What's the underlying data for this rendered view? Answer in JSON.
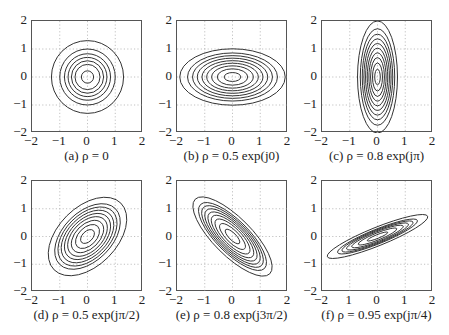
{
  "chart_data": [
    {
      "type": "contour",
      "id": "a",
      "caption": "(a) ρ = 0",
      "xlim": [
        -2,
        2
      ],
      "ylim": [
        -2,
        2
      ],
      "xticks": [
        "−2",
        "−1",
        "0",
        "1",
        "2"
      ],
      "yticks": [
        "2",
        "1",
        "0",
        "−1",
        "−2"
      ],
      "grid": "dotted",
      "contours": {
        "rx": [
          0.22,
          0.45,
          0.58,
          0.7,
          0.83,
          1.0,
          1.3
        ],
        "ry_ratio": 1.0,
        "angle_deg": 0
      }
    },
    {
      "type": "contour",
      "id": "b",
      "caption": "(b) ρ = 0.5 exp(j0)",
      "xlim": [
        -2,
        2
      ],
      "ylim": [
        -2,
        2
      ],
      "xticks": [
        "−2",
        "−1",
        "0",
        "1",
        "2"
      ],
      "yticks": [
        "2",
        "1",
        "0",
        "−1",
        "−2"
      ],
      "grid": "dotted",
      "contours": {
        "rx": [
          0.3,
          0.55,
          0.75,
          0.93,
          1.1,
          1.27,
          1.44,
          1.62,
          1.9
        ],
        "ry_ratio": 0.53,
        "angle_deg": 0
      }
    },
    {
      "type": "contour",
      "id": "c",
      "caption": "(c) ρ = 0.8 exp(jπ)",
      "xlim": [
        -2,
        2
      ],
      "ylim": [
        -2,
        2
      ],
      "xticks": [
        "−2",
        "−1",
        "0",
        "1",
        "2"
      ],
      "yticks": [
        "2",
        "1",
        "0",
        "−1",
        "−2"
      ],
      "grid": "dotted",
      "contours": {
        "rx": [
          0.1,
          0.18,
          0.25,
          0.31,
          0.37,
          0.43,
          0.49,
          0.55,
          0.62,
          0.72
        ],
        "ry_ratio": 2.78,
        "angle_deg": 0
      }
    },
    {
      "type": "contour",
      "id": "d",
      "caption": "(d) ρ = 0.5 exp(jπ/2)",
      "xlim": [
        -2,
        2
      ],
      "ylim": [
        -2,
        2
      ],
      "xticks": [
        "−2",
        "−1",
        "0",
        "1",
        "2"
      ],
      "yticks": [
        "2",
        "1",
        "0",
        "−1",
        "−2"
      ],
      "grid": "dotted",
      "contours": {
        "rx": [
          0.3,
          0.52,
          0.7,
          0.86,
          1.0,
          1.14,
          1.28,
          1.42,
          1.7
        ],
        "ry_ratio": 0.62,
        "angle_deg": 45
      }
    },
    {
      "type": "contour",
      "id": "e",
      "caption": "(e) ρ = 0.8 exp(j3π/2)",
      "xlim": [
        -2,
        2
      ],
      "ylim": [
        -2,
        2
      ],
      "xticks": [
        "−2",
        "−1",
        "0",
        "1",
        "2"
      ],
      "yticks": [
        "2",
        "1",
        "0",
        "−1",
        "−2"
      ],
      "grid": "dotted",
      "contours": {
        "rx": [
          0.35,
          0.62,
          0.84,
          1.02,
          1.18,
          1.33,
          1.48,
          1.63,
          1.9
        ],
        "ry_ratio": 0.36,
        "angle_deg": -45
      }
    },
    {
      "type": "contour",
      "id": "f",
      "caption": "(f) ρ = 0.95 exp(jπ/4)",
      "xlim": [
        -2,
        2
      ],
      "ylim": [
        -2,
        2
      ],
      "xticks": [
        "−2",
        "1",
        "0",
        "1",
        "2"
      ],
      "yticks": [
        "2",
        "1",
        "0",
        "−1",
        "−2"
      ],
      "grid": "dotted",
      "contours": {
        "rx": [
          0.4,
          0.75,
          1.0,
          1.2,
          1.38,
          1.55,
          1.95
        ],
        "ry_ratio": 0.17,
        "angle_deg": 22
      }
    }
  ]
}
